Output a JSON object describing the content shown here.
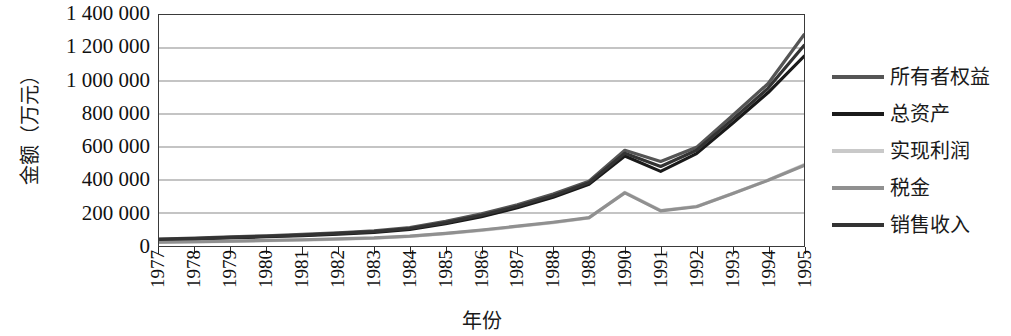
{
  "chart_data": {
    "type": "line",
    "title": "",
    "xlabel": "年份",
    "ylabel": "金额（万元）",
    "x": [
      1977,
      1978,
      1979,
      1980,
      1981,
      1982,
      1983,
      1984,
      1985,
      1986,
      1987,
      1988,
      1989,
      1990,
      1991,
      1992,
      1993,
      1994,
      1995
    ],
    "categories": [
      "1977",
      "1978",
      "1979",
      "1980",
      "1981",
      "1982",
      "1983",
      "1984",
      "1985",
      "1986",
      "1987",
      "1988",
      "1989",
      "1990",
      "1991",
      "1992",
      "1993",
      "1994",
      "1995"
    ],
    "ylim": [
      0,
      1400000
    ],
    "yticks": [
      0,
      200000,
      400000,
      600000,
      800000,
      1000000,
      1200000,
      1400000
    ],
    "ytick_labels": [
      "0",
      "200 000",
      "400 000",
      "600 000",
      "800 000",
      "1 000 000",
      "1 200 000",
      "1 400 000"
    ],
    "grid": true,
    "grid_axis": "y",
    "legend_position": "right",
    "series": [
      {
        "name": "所有者权益",
        "color": "#555555",
        "width": 3.2,
        "values": [
          42000,
          48000,
          55000,
          62000,
          70000,
          80000,
          92000,
          112000,
          150000,
          195000,
          250000,
          315000,
          392000,
          580000,
          512000,
          598000,
          790000,
          985000,
          1280000
        ]
      },
      {
        "name": "总资产",
        "color": "#1a1a1a",
        "width": 3.2,
        "values": [
          38000,
          43000,
          49000,
          56000,
          63000,
          72000,
          83000,
          100000,
          135000,
          178000,
          232000,
          296000,
          374000,
          545000,
          452000,
          560000,
          742000,
          930000,
          1150000
        ]
      },
      {
        "name": "实现利润",
        "color": "#c9c9c9",
        "width": 3.2,
        "values": [
          22000,
          25000,
          28000,
          32000,
          36000,
          41000,
          47000,
          58000,
          75000,
          95000,
          118000,
          142000,
          170000,
          325000,
          215000,
          240000,
          318000,
          400000,
          492000
        ]
      },
      {
        "name": "税金",
        "color": "#909090",
        "width": 3.2,
        "values": [
          24000,
          27000,
          30000,
          34000,
          38000,
          43000,
          49000,
          60000,
          77000,
          97000,
          120000,
          144000,
          172000,
          322000,
          213000,
          238000,
          316000,
          398000,
          488000
        ]
      },
      {
        "name": "销售收入",
        "color": "#333333",
        "width": 3.2,
        "values": [
          40000,
          45000,
          52000,
          59000,
          66000,
          76000,
          87000,
          106000,
          142000,
          186000,
          241000,
          305000,
          383000,
          562000,
          482000,
          580000,
          766000,
          957000,
          1215000
        ]
      }
    ]
  },
  "legend": {
    "items": [
      {
        "label": "所有者权益",
        "color": "#555555"
      },
      {
        "label": "总资产",
        "color": "#1a1a1a"
      },
      {
        "label": "实现利润",
        "color": "#c9c9c9"
      },
      {
        "label": "税金",
        "color": "#909090"
      },
      {
        "label": "销售收入",
        "color": "#333333"
      }
    ]
  }
}
